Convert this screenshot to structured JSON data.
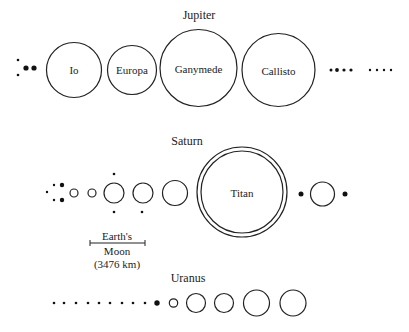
{
  "figure": {
    "background": "#ffffff",
    "ink": "#222222"
  },
  "jupiter": {
    "title": "Jupiter",
    "moons": [
      {
        "name": "Io",
        "label": "Io"
      },
      {
        "name": "Europa",
        "label": "Europa"
      },
      {
        "name": "Ganymede",
        "label": "Ganymede"
      },
      {
        "name": "Callisto",
        "label": "Callisto"
      }
    ],
    "left_small_moons_count": 4,
    "right_outer_dots_group1": 4,
    "right_outer_dots_group2": 4
  },
  "saturn": {
    "title": "Saturn",
    "titan_label": "Titan",
    "scale_bar": {
      "line1": "Earth's",
      "line2": "Moon",
      "line3": "(3476 km)"
    }
  },
  "uranus": {
    "title": "Uranus",
    "small_dots_count": 9,
    "large_moons_count": 5
  }
}
